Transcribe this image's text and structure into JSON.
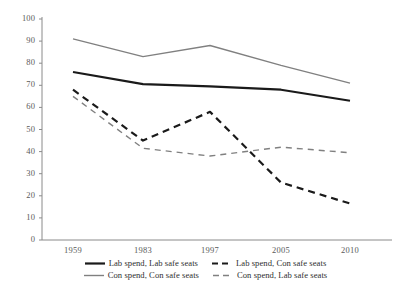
{
  "chart_data": {
    "type": "line",
    "title": "",
    "xlabel": "",
    "ylabel": "",
    "categories": [
      "1959",
      "1983",
      "1997",
      "2005",
      "2010"
    ],
    "ylim": [
      0,
      100
    ],
    "yticks": [
      0,
      10,
      20,
      30,
      40,
      50,
      60,
      70,
      80,
      90,
      100
    ],
    "grid": false,
    "legend_position": "bottom",
    "series": [
      {
        "name": "Lab spend, Lab safe seats",
        "values": [
          76,
          70.5,
          69.5,
          68,
          63
        ],
        "color": "#1a1a1a",
        "style": "solid",
        "width": 2.2
      },
      {
        "name": "Lab spend, Con safe seats",
        "values": [
          68,
          45,
          58,
          26,
          16.5
        ],
        "color": "#1a1a1a",
        "style": "dashed",
        "width": 2.2
      },
      {
        "name": "Con spend, Con safe seats",
        "values": [
          91,
          83,
          88,
          79,
          71
        ],
        "color": "#808080",
        "style": "solid",
        "width": 1.4
      },
      {
        "name": "Con spend, Lab safe seats",
        "values": [
          65,
          41.5,
          38,
          42,
          39.5
        ],
        "color": "#808080",
        "style": "dashed",
        "width": 1.4
      }
    ]
  },
  "axis": {
    "y_labels": [
      "100",
      "90",
      "80",
      "70",
      "60",
      "50",
      "40",
      "30",
      "20",
      "10",
      "0"
    ],
    "x_labels": [
      "1959",
      "1983",
      "1997",
      "2005",
      "2010"
    ],
    "axis_color": "#8a8a8a"
  },
  "legend": {
    "rows": [
      [
        {
          "label": "Lab spend, Lab safe seats",
          "series": 0
        },
        {
          "label": "Lab spend, Con safe seats",
          "series": 1
        }
      ],
      [
        {
          "label": "Con spend, Con safe seats",
          "series": 2
        },
        {
          "label": "Con spend, Lab safe seats",
          "series": 3
        }
      ]
    ]
  }
}
